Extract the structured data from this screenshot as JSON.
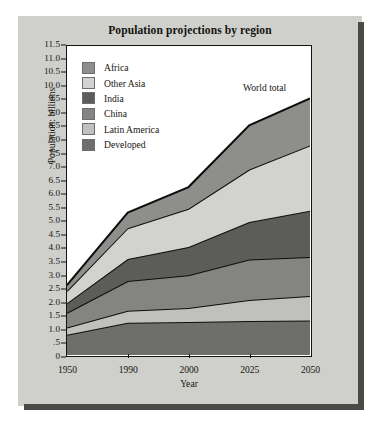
{
  "title": "Population projections by region",
  "annotation": "World total",
  "axes": {
    "ylabel": "Population: billions",
    "xlabel": "Year",
    "yticks": [
      "11.5",
      "11.0",
      "10.5",
      "10.0",
      "9.5",
      "9.0",
      "8.5",
      "8.0",
      "7.5",
      "7.0",
      "6.5",
      "6.0",
      "5.5",
      "5.0",
      "4.5",
      "4.0",
      "3.5",
      "3.0",
      "2.5",
      "2.0",
      "1.5",
      "1.0",
      ".5",
      "0"
    ],
    "xticks": [
      "1950",
      "1990",
      "2000",
      "2025",
      "2050"
    ]
  },
  "legend": {
    "items": [
      {
        "label": "Africa",
        "color": "#8e8e8c"
      },
      {
        "label": "Other Asia",
        "color": "#d2d2d0"
      },
      {
        "label": "India",
        "color": "#5c5c5a"
      },
      {
        "label": "China",
        "color": "#848482"
      },
      {
        "label": "Latin America",
        "color": "#c0c0be"
      },
      {
        "label": "Developed",
        "color": "#6e6e6c"
      }
    ]
  },
  "chart_data": {
    "type": "area",
    "stacked": true,
    "title": "Population projections by region",
    "xlabel": "Year",
    "ylabel": "Population: billions",
    "annotations": [
      "World total"
    ],
    "grid": false,
    "legend_position": "inside-top-left",
    "categories": [
      "1950",
      "1990",
      "2000",
      "2025",
      "2050"
    ],
    "ylim": [
      0,
      11.5
    ],
    "ytick_step": 0.5,
    "x_scale": "categorical",
    "stack_order_bottom_to_top": [
      "Developed",
      "Latin America",
      "China",
      "India",
      "Other Asia",
      "Africa"
    ],
    "series": [
      {
        "name": "Developed",
        "color": "#6e6e6c",
        "values": [
          0.75,
          1.2,
          1.23,
          1.27,
          1.28
        ]
      },
      {
        "name": "Latin America",
        "color": "#c0c0be",
        "values": [
          0.27,
          0.45,
          0.52,
          0.78,
          0.92
        ]
      },
      {
        "name": "China",
        "color": "#848482",
        "values": [
          0.55,
          1.1,
          1.22,
          1.5,
          1.45
        ]
      },
      {
        "name": "India",
        "color": "#5c5c5a",
        "values": [
          0.36,
          0.82,
          1.05,
          1.4,
          1.72
        ]
      },
      {
        "name": "Other Asia",
        "color": "#d2d2d0",
        "values": [
          0.45,
          1.15,
          1.42,
          1.95,
          2.43
        ]
      },
      {
        "name": "Africa",
        "color": "#8e8e8c",
        "values": [
          0.22,
          0.58,
          0.81,
          1.65,
          1.75
        ]
      }
    ],
    "cumulative_tops": {
      "Developed": [
        0.75,
        1.2,
        1.23,
        1.27,
        1.28
      ],
      "Latin America": [
        1.02,
        1.65,
        1.75,
        2.05,
        2.2
      ],
      "China": [
        1.57,
        2.75,
        2.97,
        3.55,
        3.65
      ],
      "India": [
        1.93,
        3.57,
        4.02,
        4.95,
        5.37
      ],
      "Other Asia": [
        2.38,
        4.72,
        5.44,
        6.9,
        7.8
      ],
      "Africa": [
        2.6,
        5.3,
        6.25,
        8.55,
        9.55
      ]
    },
    "world_total": [
      2.6,
      5.3,
      6.25,
      8.55,
      9.55
    ]
  }
}
